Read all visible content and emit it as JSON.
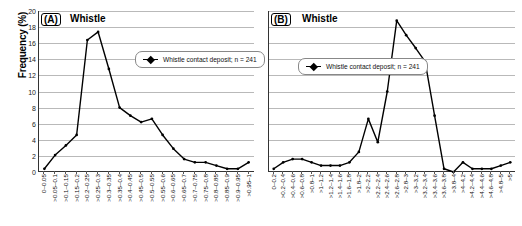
{
  "figure": {
    "ylabel": "Frequency (%)",
    "panels": [
      {
        "tag": "(A)",
        "title": "Whistle",
        "legend": "Whistle contact deposit; n = 241"
      },
      {
        "tag": "(B)",
        "title": "Whistle",
        "legend": "Whistle contact deposit; n = 241"
      }
    ]
  },
  "chart_data": [
    {
      "type": "line",
      "title": "(A) Whistle",
      "xlabel": "",
      "ylabel": "Frequency (%)",
      "ylim": [
        0,
        20
      ],
      "yticks": [
        0,
        2,
        4,
        6,
        8,
        10,
        12,
        14,
        16,
        18,
        20
      ],
      "grid": true,
      "legend_position": "inside-upper-right",
      "series": [
        {
          "name": "Whistle contact deposit; n = 241",
          "categories": [
            "0-0.05",
            ">0.05-0.1",
            ">0.1-0.15",
            ">0.15-0.2",
            ">0.2-0.25",
            ">0.25-0.3",
            ">0.3-0.35",
            ">0.35-0.4",
            ">0.4-0.45",
            ">0.45-0.5",
            ">0.5-0.55",
            ">0.55-0.6",
            ">0.6-0.65",
            ">0.65-0.7",
            ">0.7-0.75",
            ">0.75-0.8",
            ">0.8-0.85",
            ">0.85-0.9",
            ">0.9-0.95",
            ">0.95-1"
          ],
          "values": [
            0.4,
            2.1,
            3.3,
            4.6,
            16.4,
            17.4,
            12.8,
            8.0,
            7.0,
            6.2,
            6.6,
            4.6,
            2.9,
            1.6,
            1.2,
            1.2,
            0.8,
            0.4,
            0.4,
            1.2
          ]
        }
      ]
    },
    {
      "type": "line",
      "title": "(B) Whistle",
      "xlabel": "",
      "ylabel": "Frequency (%)",
      "ylim": [
        0,
        20
      ],
      "yticks": [
        0,
        2,
        4,
        6,
        8,
        10,
        12,
        14,
        16,
        18,
        20
      ],
      "grid": true,
      "legend_position": "inside-upper-left",
      "series": [
        {
          "name": "Whistle contact deposit; n = 241",
          "categories": [
            "0-0.2",
            ">0.2-0.4",
            ">0.4-0.6",
            ">0.6-0.8",
            ">0.8-1",
            ">1-1.2",
            ">1.2-1.4",
            ">1.4-1.6",
            ">1.6-1.8",
            ">1.8-2",
            ">2-2.2",
            ">2.2-2.4",
            ">2.4-2.6",
            ">2.6-2.8",
            ">2.8-3",
            ">3-3.2",
            ">3.2-3.4",
            ">3.4-3.6",
            ">3.6-3.8",
            ">3.8-4",
            ">4-4.2",
            ">4.2-4.4",
            ">4.4-4.6",
            ">4.6-4.8",
            ">4.8-5",
            ">5"
          ],
          "values": [
            0.4,
            1.2,
            1.6,
            1.6,
            1.2,
            0.8,
            0.8,
            0.8,
            1.2,
            2.5,
            6.6,
            3.7,
            10.0,
            18.8,
            17.0,
            15.4,
            13.7,
            7.0,
            0.4,
            0.0,
            1.2,
            0.4,
            0.4,
            0.4,
            0.8,
            1.2
          ]
        }
      ]
    }
  ]
}
